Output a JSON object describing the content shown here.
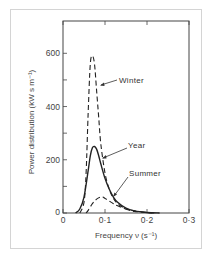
{
  "chart_data": {
    "type": "line",
    "title": "",
    "xlabel": "Frequency ν (s⁻¹)",
    "ylabel": "Power distribution (kW s m⁻¹)",
    "xlim": [
      0,
      0.3
    ],
    "ylim": [
      0,
      700
    ],
    "xticks": [
      0,
      0.1,
      0.2,
      0.3
    ],
    "xtick_labels": [
      "0",
      "0·1",
      "0·2",
      "0·3"
    ],
    "yticks": [
      0,
      100,
      200,
      300,
      400,
      500,
      600
    ],
    "ytick_labels": [
      "0",
      "",
      "200",
      "",
      "400",
      "",
      "600"
    ],
    "grid": false,
    "legend": "inline annotations with arrows",
    "series": [
      {
        "name": "Winter",
        "style": "dashed",
        "x": [
          0.04,
          0.05,
          0.055,
          0.06,
          0.065,
          0.07,
          0.075,
          0.08,
          0.085,
          0.09,
          0.1,
          0.11,
          0.12,
          0.13,
          0.15,
          0.17,
          0.2,
          0.22
        ],
        "y": [
          0,
          40,
          150,
          380,
          560,
          590,
          560,
          460,
          360,
          260,
          150,
          90,
          55,
          35,
          15,
          6,
          2,
          0
        ]
      },
      {
        "name": "Year",
        "style": "solid",
        "x": [
          0.03,
          0.04,
          0.05,
          0.06,
          0.065,
          0.07,
          0.075,
          0.08,
          0.085,
          0.09,
          0.1,
          0.11,
          0.12,
          0.13,
          0.15,
          0.17,
          0.2,
          0.23
        ],
        "y": [
          0,
          15,
          60,
          160,
          215,
          245,
          250,
          240,
          215,
          185,
          130,
          90,
          60,
          40,
          18,
          8,
          2,
          0
        ]
      },
      {
        "name": "Summer",
        "style": "dashed",
        "x": [
          0.055,
          0.06,
          0.07,
          0.08,
          0.09,
          0.095,
          0.1,
          0.11,
          0.12,
          0.13,
          0.15,
          0.17,
          0.2,
          0.22
        ],
        "y": [
          0,
          10,
          35,
          52,
          60,
          60,
          55,
          45,
          35,
          27,
          15,
          8,
          2,
          0
        ]
      }
    ],
    "annotations": [
      {
        "text": "Winter",
        "points_to_series": "Winter"
      },
      {
        "text": "Year",
        "points_to_series": "Year"
      },
      {
        "text": "Summer",
        "points_to_series": "Summer"
      }
    ]
  },
  "labels": {
    "winter": "Winter",
    "year": "Year",
    "summer": "Summer",
    "xlabel": "Frequency ν (s⁻¹)",
    "ylabel": "Power distribution (kW s m⁻¹)",
    "x0": "0",
    "x1": "0·1",
    "x2": "0·2",
    "x3": "0·3",
    "y0": "0",
    "y200": "200",
    "y400": "400",
    "y600": "600"
  },
  "colors": {
    "ink": "#333333",
    "frame": "#d4d4d4"
  }
}
